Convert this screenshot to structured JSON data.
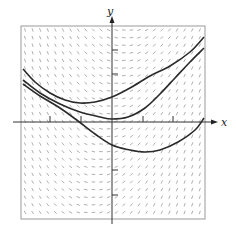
{
  "chart_data": {
    "type": "line",
    "title": "",
    "subtitle": "Slope field with three solution curves",
    "xlabel": "x",
    "ylabel": "y",
    "grid": false,
    "legend": null,
    "pixel_frame": {
      "left": 21,
      "top": 26,
      "right": 205,
      "bottom": 219
    },
    "origin_px": {
      "x": 112,
      "y": 122
    },
    "x_tick_px": [
      50,
      81,
      143,
      173
    ],
    "y_tick_px": [
      50,
      74,
      170,
      195
    ],
    "slope_field": {
      "spacing_px": 7.6,
      "description": "Short segments; negative slopes on left, near-horizontal near y-axis, positive slopes on right"
    },
    "series": [
      {
        "name": "upper-curve",
        "points_px": [
          [
            23,
            69
          ],
          [
            35,
            82
          ],
          [
            50,
            93
          ],
          [
            65,
            100
          ],
          [
            80,
            103
          ],
          [
            95,
            102
          ],
          [
            112,
            97
          ],
          [
            130,
            88
          ],
          [
            150,
            76
          ],
          [
            170,
            66
          ],
          [
            190,
            52
          ],
          [
            204,
            37
          ]
        ]
      },
      {
        "name": "middle-curve",
        "points_px": [
          [
            23,
            80
          ],
          [
            40,
            93
          ],
          [
            60,
            104
          ],
          [
            80,
            112
          ],
          [
            100,
            117
          ],
          [
            112,
            119
          ],
          [
            128,
            117
          ],
          [
            145,
            108
          ],
          [
            160,
            94
          ],
          [
            175,
            78
          ],
          [
            190,
            62
          ],
          [
            204,
            48
          ]
        ]
      },
      {
        "name": "lower-curve",
        "points_px": [
          [
            23,
            84
          ],
          [
            40,
            96
          ],
          [
            60,
            108
          ],
          [
            78,
            121
          ],
          [
            95,
            134
          ],
          [
            112,
            145
          ],
          [
            130,
            150
          ],
          [
            145,
            152
          ],
          [
            160,
            150
          ],
          [
            178,
            142
          ],
          [
            195,
            130
          ],
          [
            204,
            118
          ]
        ]
      }
    ]
  },
  "axes": {
    "x_label": "x",
    "y_label": "y"
  }
}
